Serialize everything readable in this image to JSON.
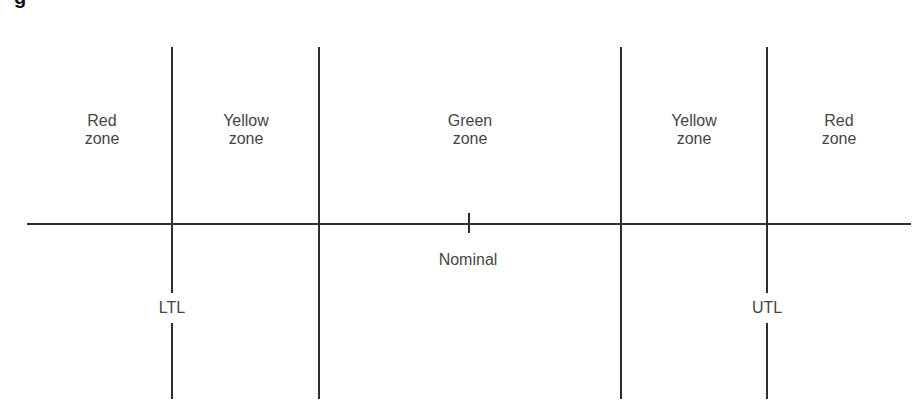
{
  "caption": {
    "visible_fragment": "g"
  },
  "diagram": {
    "type": "tolerance-zone-diagram",
    "zones": [
      {
        "line1": "Red",
        "line2": "zone",
        "color_name": "red"
      },
      {
        "line1": "Yellow",
        "line2": "zone",
        "color_name": "yellow"
      },
      {
        "line1": "Green",
        "line2": "zone",
        "color_name": "green"
      },
      {
        "line1": "Yellow",
        "line2": "zone",
        "color_name": "yellow"
      },
      {
        "line1": "Red",
        "line2": "zone",
        "color_name": "red"
      }
    ],
    "limits": {
      "lower": "LTL",
      "upper": "UTL"
    },
    "nominal": "Nominal",
    "line_color": "#2e2e2e",
    "text_color": "#454545"
  }
}
